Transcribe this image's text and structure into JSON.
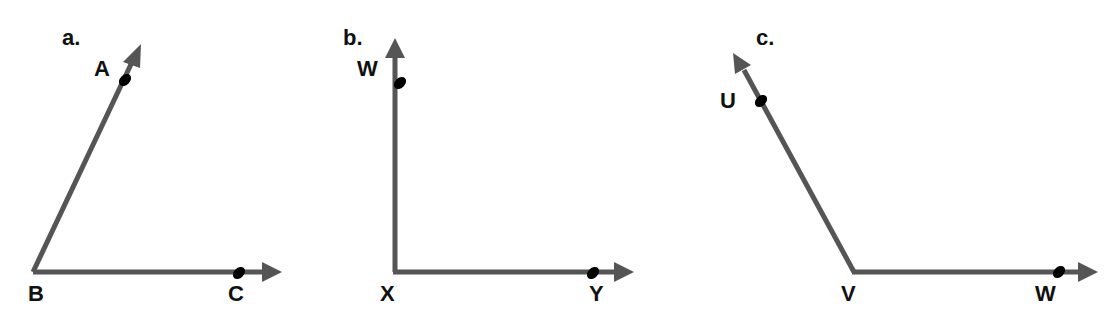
{
  "diagrams": [
    {
      "panel_label": "a.",
      "vertex": "B",
      "points": [
        "A",
        "C"
      ],
      "labels": {
        "A": "A",
        "B": "B",
        "C": "C"
      },
      "description": "acute angle ABC"
    },
    {
      "panel_label": "b.",
      "vertex": "X",
      "points": [
        "W",
        "Y"
      ],
      "labels": {
        "W": "W",
        "X": "X",
        "Y": "Y"
      },
      "description": "right angle WXY"
    },
    {
      "panel_label": "c.",
      "vertex": "V",
      "points": [
        "U",
        "W"
      ],
      "labels": {
        "U": "U",
        "V": "V",
        "W": "W"
      },
      "description": "obtuse angle UVW"
    }
  ],
  "colors": {
    "ray": "#555555",
    "point": "#000000",
    "label": "#111111",
    "background": "#ffffff"
  }
}
